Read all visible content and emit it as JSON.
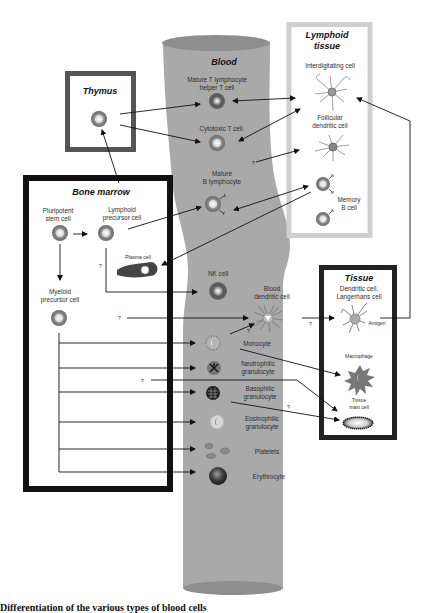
{
  "figure": {
    "caption": "Differentiation of the various types of blood cells",
    "colors": {
      "blood_vessel": "#a9a9a9",
      "blood_vessel_cap": "#8e8e8e",
      "thymus_border": "#555555",
      "lymphoid_border": "#cfcfcf",
      "bone_marrow_border": "#111111",
      "tissue_border": "#222222",
      "arrow": "#111111"
    }
  },
  "compartments": {
    "thymus": {
      "title": "Thymus"
    },
    "blood": {
      "title": "Blood"
    },
    "lymphoid_tissue": {
      "title_line1": "Lymphoid",
      "title_line2": "tissue"
    },
    "bone_marrow": {
      "title": "Bone marrow"
    },
    "tissue": {
      "title": "Tissue"
    }
  },
  "cells": {
    "helper_t": {
      "line1": "Mature T lymphocyte",
      "line2": "helper T cell"
    },
    "cytotoxic_t": {
      "line1": "Cytotoxic T cell"
    },
    "mature_b": {
      "line1": "Mature",
      "line2": "B lymphocyte"
    },
    "nk": {
      "line1": "NK cell"
    },
    "blood_dendritic": {
      "line1": "Blood",
      "line2": "dendritic cell"
    },
    "monocyte": {
      "line1": "Monocyte"
    },
    "neutrophil": {
      "line1": "Neutrophilic",
      "line2": "granulocyte"
    },
    "basophil": {
      "line1": "Basophilic",
      "line2": "granulocyte"
    },
    "eosinophil": {
      "line1": "Eosinophilic",
      "line2": "granulocyte"
    },
    "platelets": {
      "line1": "Platelets"
    },
    "erythrocyte": {
      "line1": "Erythrocyte"
    },
    "interdigitating": {
      "line1": "Interdigitating cell"
    },
    "follicular_dendritic": {
      "line1": "Follicular",
      "line2": "dendritic cell"
    },
    "memory_b": {
      "line1": "Memory",
      "line2": "B cell"
    },
    "pluripotent": {
      "line1": "Pluripotent",
      "line2": "stem cell"
    },
    "lymphoid_precursor": {
      "line1": "Lymphoid",
      "line2": "precursor cell"
    },
    "plasma": {
      "line1": "Plasma cell"
    },
    "myeloid_precursor": {
      "line1": "Myeloid",
      "line2": "precursor cell"
    },
    "tissue_dendritic": {
      "line1": "Dendritic cell,",
      "line2": "Langerhans cell",
      "antigen": "Antigen"
    },
    "macrophage": {
      "line1": "Macrophage"
    },
    "mast": {
      "line1": "Tissue",
      "line2": "mast cell"
    }
  },
  "uncertain_marker": "?"
}
